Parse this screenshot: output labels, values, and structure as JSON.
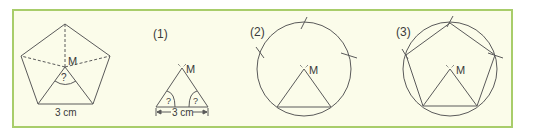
{
  "colors": {
    "frame_border": "#a8cd6a",
    "frame_fill": "#fbfcea",
    "line": "#5a5a5a",
    "text": "#3a3a3a"
  },
  "figure0": {
    "center_label": "M",
    "angle_label": "?",
    "side_label": "3 cm"
  },
  "step1": {
    "number_label": "(1)",
    "center_label": "M",
    "angle_left_label": "?",
    "angle_right_label": "?",
    "side_label": "3 cm"
  },
  "step2": {
    "number_label": "(2)",
    "center_label": "M"
  },
  "step3": {
    "number_label": "(3)",
    "center_label": "M"
  }
}
